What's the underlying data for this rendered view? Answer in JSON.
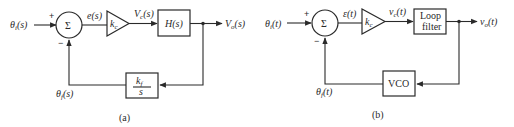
{
  "diagram_a": {
    "caption": "(a)",
    "input_label": "θi(s)",
    "input_main": "θ",
    "input_sub": "i",
    "input_arg": "(s)",
    "plus_sign": "+",
    "minus_sign": "−",
    "sum_symbol": "Σ",
    "error_label": "e(s)",
    "gain_label": "k",
    "gain_sub": "c",
    "control_main": "V",
    "control_sub": "c",
    "control_arg": "(s)",
    "filter_label": "H(s)",
    "output_main": "V",
    "output_sub": "o",
    "output_arg": "(s)",
    "feedback_num": "k",
    "feedback_num_sub": "f",
    "feedback_den": "s",
    "feedback_main": "θ",
    "feedback_sub": "f",
    "feedback_arg": "(s)"
  },
  "diagram_b": {
    "caption": "(b)",
    "input_main": "θ",
    "input_sub": "i",
    "input_arg": "(t)",
    "plus_sign": "+",
    "minus_sign": "−",
    "sum_symbol": "Σ",
    "error_label": "ε(t)",
    "gain_label": "k",
    "gain_sub": "c",
    "control_main": "v",
    "control_sub": "c",
    "control_arg": "(t)",
    "filter_line1": "Loop",
    "filter_line2": "filter",
    "output_main": "v",
    "output_sub": "o",
    "output_arg": "(t)",
    "vco_label": "VCO",
    "feedback_main": "θ",
    "feedback_sub": "f",
    "feedback_arg": "(t)"
  },
  "colors": {
    "ink": "#2a2a2a",
    "background": "#ffffff"
  }
}
